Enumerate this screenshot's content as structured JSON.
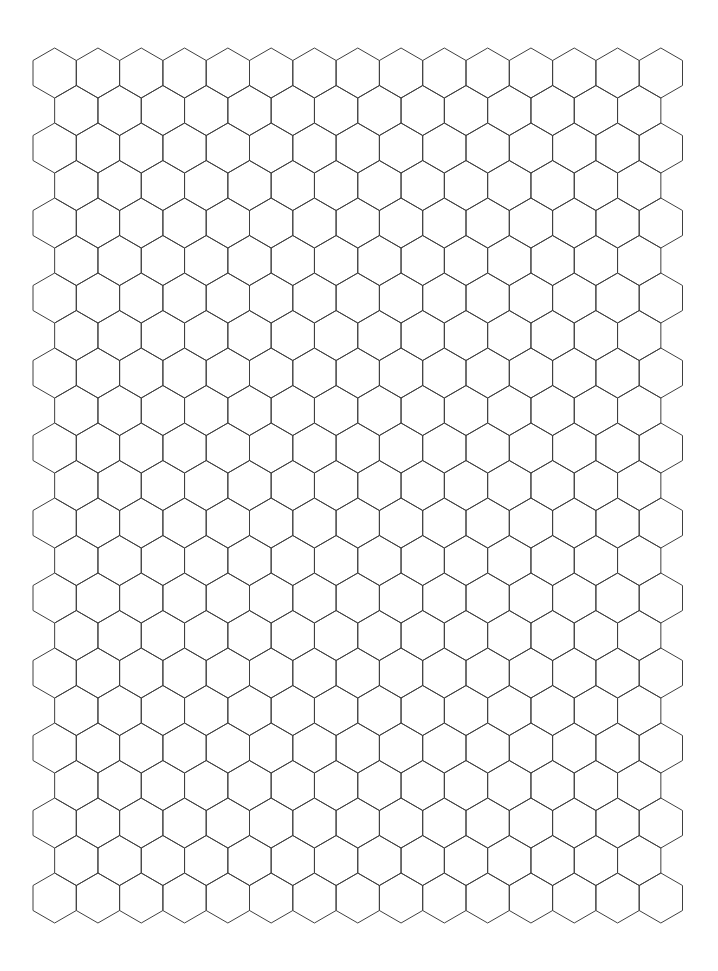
{
  "document": {
    "title": "Hexagon Graph Paper",
    "kind": "hexagonal-grid-sheet",
    "page_width": 718,
    "page_height": 971,
    "background_color": "#ffffff"
  },
  "grid": {
    "name": "hexagon-tiling",
    "orientation": "pointy-top",
    "stroke_color": "#3f3f3f",
    "stroke_width": 1,
    "fill_color": "none",
    "columns": 15,
    "rows": 12,
    "hex_width": 43.3,
    "hex_height": 50,
    "hex_side": 25,
    "column_pitch": 43.3,
    "row_pitch": 75,
    "origin_x": 33,
    "origin_y": 48,
    "extent_left": 33,
    "extent_top": 48,
    "extent_right": 683,
    "extent_bottom": 923,
    "offset_rows_shift_x": 21.65,
    "margin_left": 33,
    "margin_top": 48,
    "margin_right": 35,
    "margin_bottom": 48
  },
  "chart_data": {
    "type": "table",
    "xlabel": "",
    "ylabel": "",
    "categories": [],
    "values": [],
    "geometry": {
      "tiling": "regular-hexagonal",
      "orientation": "pointy-top",
      "columns": 15,
      "rows": 12,
      "total_cells": 180,
      "hex_width_px": 43.3,
      "hex_height_px": 50,
      "hex_side_px": 25,
      "row_pitch_px": 75,
      "column_pitch_px": 43.3
    },
    "grid": true,
    "legend": "none"
  }
}
